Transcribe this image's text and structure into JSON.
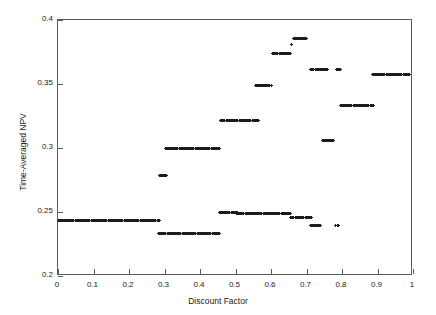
{
  "chart_data": {
    "type": "scatter",
    "title": "",
    "xlabel": "Discount Factor",
    "ylabel": "Time-Averaged NPV",
    "xlim": [
      0,
      1
    ],
    "ylim": [
      0.2,
      0.4
    ],
    "xticks": [
      "0",
      "0.1",
      "0.2",
      "0.3",
      "0.4",
      "0.5",
      "0.6",
      "0.7",
      "0.8",
      "0.9",
      "1"
    ],
    "xtick_values": [
      0,
      0.1,
      0.2,
      0.3,
      0.4,
      0.5,
      0.6,
      0.7,
      0.8,
      0.9,
      1.0
    ],
    "yticks": [
      "0.2",
      "0.25",
      "0.3",
      "0.35",
      "0.4"
    ],
    "ytick_values": [
      0.2,
      0.25,
      0.3,
      0.35,
      0.4
    ],
    "grid": false,
    "legend": false,
    "marker": "plus",
    "marker_color": "#1c1c1c",
    "segments": [
      {
        "name": "level-0.2435-left",
        "y": 0.2435,
        "x_start": 0.0,
        "x_end": 0.285,
        "n": 96
      },
      {
        "name": "level-0.2335",
        "y": 0.2335,
        "x_start": 0.283,
        "x_end": 0.455,
        "n": 58
      },
      {
        "name": "level-0.2785",
        "y": 0.2785,
        "x_start": 0.287,
        "x_end": 0.307,
        "n": 9
      },
      {
        "name": "level-0.2995",
        "y": 0.2995,
        "x_start": 0.302,
        "x_end": 0.455,
        "n": 52
      },
      {
        "name": "level-0.2500",
        "y": 0.25,
        "x_start": 0.455,
        "x_end": 0.505,
        "n": 18
      },
      {
        "name": "level-0.2490",
        "y": 0.249,
        "x_start": 0.503,
        "x_end": 0.655,
        "n": 52
      },
      {
        "name": "level-0.3215",
        "y": 0.3215,
        "x_start": 0.458,
        "x_end": 0.565,
        "n": 36
      },
      {
        "name": "level-0.3485",
        "y": 0.3485,
        "x_start": 0.555,
        "x_end": 0.6,
        "n": 16
      },
      {
        "name": "level-0.3735",
        "y": 0.3735,
        "x_start": 0.605,
        "x_end": 0.655,
        "n": 18
      },
      {
        "name": "level-0.3855-peak",
        "y": 0.3855,
        "x_start": 0.662,
        "x_end": 0.7,
        "n": 14
      },
      {
        "name": "point-0.3805",
        "y": 0.3805,
        "x_start": 0.658,
        "x_end": 0.66,
        "n": 1
      },
      {
        "name": "level-0.2455",
        "y": 0.2455,
        "x_start": 0.655,
        "x_end": 0.715,
        "n": 20
      },
      {
        "name": "level-0.2395",
        "y": 0.2395,
        "x_start": 0.712,
        "x_end": 0.74,
        "n": 11
      },
      {
        "name": "level-0.3615-a",
        "y": 0.3615,
        "x_start": 0.712,
        "x_end": 0.76,
        "n": 17
      },
      {
        "name": "level-0.3055",
        "y": 0.3055,
        "x_start": 0.745,
        "x_end": 0.775,
        "n": 12
      },
      {
        "name": "point-0.2395-b",
        "y": 0.2395,
        "x_start": 0.782,
        "x_end": 0.79,
        "n": 3
      },
      {
        "name": "level-0.3615-b",
        "y": 0.3615,
        "x_start": 0.785,
        "x_end": 0.796,
        "n": 5
      },
      {
        "name": "level-0.3330",
        "y": 0.333,
        "x_start": 0.795,
        "x_end": 0.888,
        "n": 32
      },
      {
        "name": "level-0.3575",
        "y": 0.3575,
        "x_start": 0.885,
        "x_end": 0.99,
        "n": 36
      }
    ]
  }
}
